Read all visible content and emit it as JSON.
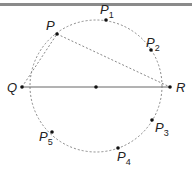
{
  "diagram": {
    "type": "geometry-circle",
    "circle": {
      "cx": 96,
      "cy": 86,
      "r": 66,
      "style": "dashed"
    },
    "colors": {
      "line": "#666666",
      "dashed": "#888888",
      "dot": "#111111",
      "rule": "#8a8a8a"
    },
    "points": [
      {
        "id": "P",
        "label": "P",
        "sub": "",
        "x": 57,
        "y": 34,
        "lx": 46,
        "ly": 30
      },
      {
        "id": "P1",
        "label": "P",
        "sub": "1",
        "x": 106,
        "y": 20,
        "lx": 100,
        "ly": 14
      },
      {
        "id": "P2",
        "label": "P",
        "sub": "2",
        "x": 151,
        "y": 50,
        "lx": 146,
        "ly": 47
      },
      {
        "id": "P3",
        "label": "P",
        "sub": "3",
        "x": 152,
        "y": 120,
        "lx": 155,
        "ly": 132
      },
      {
        "id": "P4",
        "label": "P",
        "sub": "4",
        "x": 118,
        "y": 148,
        "lx": 117,
        "ly": 161
      },
      {
        "id": "P5",
        "label": "P",
        "sub": "5",
        "x": 52,
        "y": 132,
        "lx": 39,
        "ly": 141
      },
      {
        "id": "Q",
        "label": "Q",
        "sub": "",
        "x": 22,
        "y": 87,
        "lx": 7,
        "ly": 92
      },
      {
        "id": "R",
        "label": "R",
        "sub": "",
        "x": 170,
        "y": 87,
        "lx": 176,
        "ly": 92
      },
      {
        "id": "O",
        "label": "",
        "sub": "",
        "x": 96,
        "y": 87,
        "lx": 0,
        "ly": 0
      }
    ],
    "segments": [
      {
        "from": "Q",
        "to": "R",
        "style": "solid"
      },
      {
        "from": "Q",
        "to": "P",
        "style": "dashed"
      },
      {
        "from": "P",
        "to": "R",
        "style": "dashed"
      }
    ],
    "labels": {
      "P": "P",
      "P1_sub": "1",
      "P2_sub": "2",
      "P3_sub": "3",
      "P4_sub": "4",
      "P5_sub": "5",
      "Q": "Q",
      "R": "R"
    }
  }
}
